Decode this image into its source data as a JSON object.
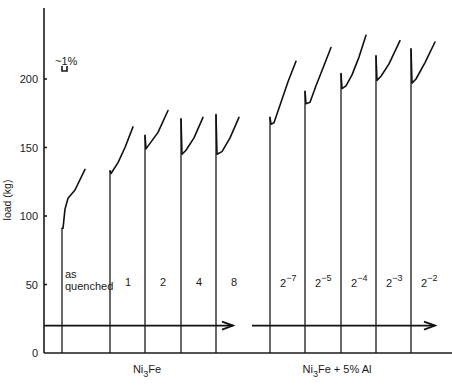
{
  "chart_data": {
    "type": "line",
    "title": "",
    "ylabel": "load (kg)",
    "xlabel": "",
    "ylim": [
      0,
      250
    ],
    "yticks": [
      0,
      50,
      100,
      150,
      200
    ],
    "grid": false,
    "scale_annotation": "~1%",
    "groups": [
      {
        "name": "Ni3Fe",
        "label_main": "Ni",
        "label_sub": "3",
        "label_rest": "Fe",
        "series": [
          {
            "condition": "as quenched",
            "line1": "as",
            "line2": "quenched",
            "x0": 62,
            "initial_peak_kg": 91,
            "yield_drop_kg": 91,
            "final_kg": 134,
            "curve": [
              [
                63,
                91
              ],
              [
                65,
                105
              ],
              [
                68,
                113
              ],
              [
                75,
                119
              ],
              [
                85,
                134
              ]
            ]
          },
          {
            "condition": "1",
            "x0": 110,
            "initial_peak_kg": 133,
            "yield_drop_kg": 131,
            "final_kg": 165,
            "curve": [
              [
                111,
                131
              ],
              [
                118,
                139
              ],
              [
                125,
                150
              ],
              [
                133,
                165
              ]
            ]
          },
          {
            "condition": "2",
            "x0": 145,
            "initial_peak_kg": 159,
            "yield_drop_kg": 149,
            "final_kg": 177,
            "curve": [
              [
                146,
                149
              ],
              [
                150,
                153
              ],
              [
                158,
                161
              ],
              [
                168,
                177
              ]
            ]
          },
          {
            "condition": "4",
            "x0": 181,
            "initial_peak_kg": 171,
            "yield_drop_kg": 145,
            "final_kg": 172,
            "curve": [
              [
                182,
                145
              ],
              [
                186,
                148
              ],
              [
                194,
                157
              ],
              [
                203,
                172
              ]
            ]
          },
          {
            "condition": "8",
            "x0": 216,
            "initial_peak_kg": 174,
            "yield_drop_kg": 145,
            "final_kg": 172,
            "curve": [
              [
                217,
                145
              ],
              [
                222,
                147
              ],
              [
                230,
                157
              ],
              [
                239,
                172
              ]
            ]
          }
        ]
      },
      {
        "name": "Ni3Fe + 5% Al",
        "label_main": "Ni",
        "label_sub": "3",
        "label_rest": "Fe + 5% Al",
        "series": [
          {
            "condition": "2^-7",
            "base": "2",
            "exp": "−7",
            "x0": 270,
            "initial_peak_kg": 172,
            "yield_drop_kg": 167,
            "final_kg": 213,
            "curve": [
              [
                271,
                167
              ],
              [
                274,
                168
              ],
              [
                281,
                183
              ],
              [
                288,
                198
              ],
              [
                296,
                213
              ]
            ]
          },
          {
            "condition": "2^-5",
            "base": "2",
            "exp": "−5",
            "x0": 305,
            "initial_peak_kg": 191,
            "yield_drop_kg": 182,
            "final_kg": 223,
            "curve": [
              [
                306,
                182
              ],
              [
                310,
                183
              ],
              [
                316,
                195
              ],
              [
                323,
                208
              ],
              [
                331,
                223
              ]
            ]
          },
          {
            "condition": "2^-4",
            "base": "2",
            "exp": "−4",
            "x0": 341,
            "initial_peak_kg": 204,
            "yield_drop_kg": 193,
            "final_kg": 232,
            "curve": [
              [
                342,
                193
              ],
              [
                346,
                195
              ],
              [
                352,
                203
              ],
              [
                359,
                216
              ],
              [
                366,
                232
              ]
            ]
          },
          {
            "condition": "2^-3",
            "base": "2",
            "exp": "−3",
            "x0": 376,
            "initial_peak_kg": 217,
            "yield_drop_kg": 199,
            "final_kg": 228,
            "curve": [
              [
                377,
                199
              ],
              [
                381,
                202
              ],
              [
                389,
                211
              ],
              [
                400,
                228
              ]
            ]
          },
          {
            "condition": "2^-2",
            "base": "2",
            "exp": "−2",
            "x0": 411,
            "initial_peak_kg": 222,
            "yield_drop_kg": 197,
            "final_kg": 227,
            "curve": [
              [
                412,
                197
              ],
              [
                416,
                200
              ],
              [
                425,
                212
              ],
              [
                435,
                227
              ]
            ]
          }
        ]
      }
    ],
    "arrows": [
      {
        "from_x": 44,
        "to_x": 233,
        "y_kg": 20
      },
      {
        "from_x": 252,
        "to_x": 435,
        "y_kg": 20
      }
    ]
  }
}
